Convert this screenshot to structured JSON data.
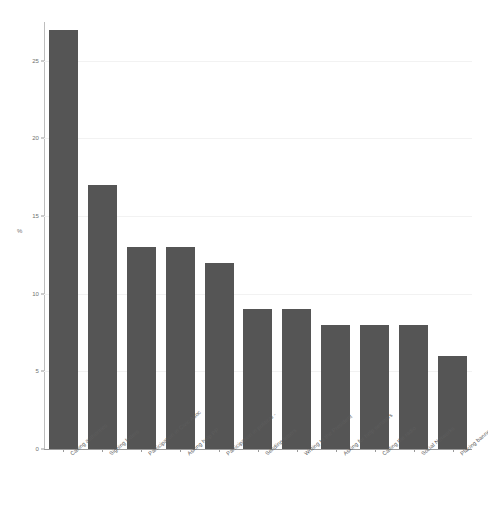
{
  "chart_data": {
    "type": "bar",
    "title": "",
    "subtitle": "",
    "xlabel": "",
    "ylabel": "%",
    "ylim": [
      0,
      27.5
    ],
    "grid": true,
    "legend": false,
    "bar_color": "#555555",
    "yticks": [
      0,
      5,
      10,
      15,
      20,
      25
    ],
    "ytick_labels": [
      "0",
      "5",
      "10",
      "15",
      "20",
      "25"
    ],
    "categories": [
      "Calling authorities",
      "Signing letters",
      "Participation in Civic Asoc",
      "Asking help PP",
      "Participation in political -",
      "Sending letters",
      "Writing to the President",
      "Asking for help senators",
      "Calling the radio",
      "Social Networks",
      "Placing banners"
    ],
    "values": [
      27,
      17,
      13,
      13,
      12,
      9,
      9,
      8,
      8,
      8,
      6
    ]
  }
}
